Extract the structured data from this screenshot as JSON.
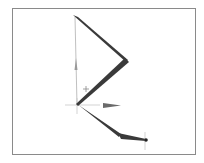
{
  "viewport": {
    "border_color": "#8a8a8a",
    "background": "#ffffff"
  },
  "armature": {
    "bone_color": "#3a3a3a",
    "joints": [
      {
        "name": "top",
        "x": 75,
        "y": 17
      },
      {
        "name": "elbow",
        "x": 127,
        "y": 61
      },
      {
        "name": "origin",
        "x": 77,
        "y": 105
      },
      {
        "name": "knee",
        "x": 121,
        "y": 136
      },
      {
        "name": "tip",
        "x": 146,
        "y": 140
      }
    ],
    "bones": [
      {
        "from": "top",
        "to": "elbow"
      },
      {
        "from": "elbow",
        "to": "origin"
      },
      {
        "from": "origin",
        "to": "knee"
      },
      {
        "from": "knee",
        "to": "tip"
      }
    ]
  },
  "gizmo": {
    "axis_color": "#9a9a9a",
    "y_arrow": {
      "x": 76,
      "y": 65
    },
    "x_arrow": {
      "x": 110,
      "y": 105
    }
  },
  "cursor": {
    "symbol": "+",
    "x": 86,
    "y": 89
  }
}
